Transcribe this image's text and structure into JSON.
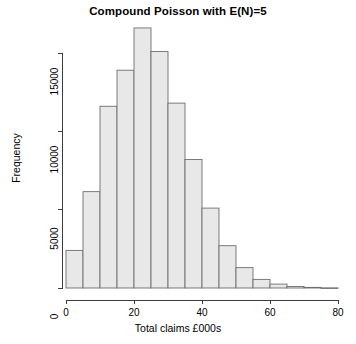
{
  "chart_data": {
    "type": "bar",
    "title": "Compound Poisson with E(N)=5",
    "xlabel": "Total claims £000s",
    "ylabel": "Frequency",
    "xlim": [
      0,
      80
    ],
    "ylim": [
      0,
      16600
    ],
    "grid": false,
    "legend": null,
    "bin_width": 5,
    "bin_starts": [
      0,
      5,
      10,
      15,
      20,
      25,
      30,
      35,
      40,
      45,
      50,
      55,
      60,
      65,
      70,
      75
    ],
    "categories": [
      "0-5",
      "5-10",
      "10-15",
      "15-20",
      "20-25",
      "25-30",
      "30-35",
      "35-40",
      "40-45",
      "45-50",
      "50-55",
      "55-60",
      "60-65",
      "65-70",
      "70-75",
      "75-80"
    ],
    "values": [
      2400,
      6150,
      11600,
      13900,
      16600,
      15100,
      11800,
      8200,
      5100,
      2700,
      1300,
      550,
      250,
      100,
      40,
      10
    ],
    "xticks": [
      0,
      20,
      40,
      60,
      80
    ],
    "xtick_labels": [
      "0",
      "20",
      "40",
      "60",
      "80"
    ],
    "yticks": [
      0,
      5000,
      10000,
      15000
    ],
    "ytick_labels": [
      "0",
      "5000",
      "10000",
      "15000"
    ],
    "bar_fill": "#e8e8e8",
    "bar_stroke": "#6e6e6e",
    "axis_color": "#3c3c3c"
  }
}
